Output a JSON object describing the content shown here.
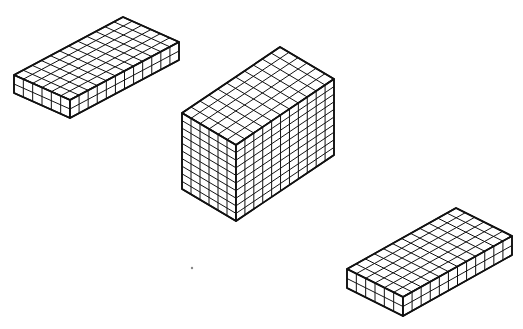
{
  "figure": {
    "width": 523,
    "height": 329,
    "line_color": "#111111",
    "face_color": "#ffffff",
    "blocks": [
      {
        "name": "block-top-left-flat",
        "left": [
          14,
          75
        ],
        "front": [
          70,
          100
        ],
        "right": [
          179,
          42
        ],
        "height_px": 18,
        "cells_short": 6,
        "cells_long": 12,
        "cells_high": 2
      },
      {
        "name": "block-center-tall",
        "left": [
          182,
          113
        ],
        "front": [
          236,
          145
        ],
        "right": [
          334,
          79
        ],
        "height_px": 76,
        "cells_short": 6,
        "cells_long": 11,
        "cells_high": 10
      },
      {
        "name": "block-bottom-right-flat",
        "left": [
          347,
          269
        ],
        "front": [
          403,
          297
        ],
        "right": [
          512,
          236
        ],
        "height_px": 19,
        "cells_short": 6,
        "cells_long": 12,
        "cells_high": 2
      }
    ],
    "dots": [
      {
        "name": "stray-dot",
        "x": 192,
        "y": 268,
        "r": 1.2
      }
    ]
  }
}
